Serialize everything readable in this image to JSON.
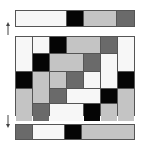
{
  "colors": {
    "white": "#f7f7f7",
    "black": "#050505",
    "lightgray": "#c4c4c4",
    "darkgray": "#6a6a6a",
    "border": "#555555"
  },
  "top_bar": {
    "segments": [
      {
        "color": "white",
        "width": 52
      },
      {
        "color": "black",
        "width": 17
      },
      {
        "color": "lightgray",
        "width": 34
      },
      {
        "color": "darkgray",
        "width": 17
      }
    ]
  },
  "grid": {
    "columns": 7,
    "rows": 5,
    "cells": [
      {
        "col": 1,
        "row": 1,
        "colspan": 1,
        "rowspan": 2,
        "color": "white"
      },
      {
        "col": 2,
        "row": 1,
        "colspan": 1,
        "rowspan": 1,
        "color": "white"
      },
      {
        "col": 3,
        "row": 1,
        "colspan": 1,
        "rowspan": 1,
        "color": "black"
      },
      {
        "col": 4,
        "row": 1,
        "colspan": 2,
        "rowspan": 1,
        "color": "lightgray"
      },
      {
        "col": 6,
        "row": 1,
        "colspan": 1,
        "rowspan": 1,
        "color": "darkgray"
      },
      {
        "col": 7,
        "row": 1,
        "colspan": 1,
        "rowspan": 2,
        "color": "white"
      },
      {
        "col": 2,
        "row": 2,
        "colspan": 1,
        "rowspan": 1,
        "color": "black"
      },
      {
        "col": 3,
        "row": 2,
        "colspan": 2,
        "rowspan": 1,
        "color": "lightgray"
      },
      {
        "col": 5,
        "row": 2,
        "colspan": 1,
        "rowspan": 1,
        "color": "darkgray"
      },
      {
        "col": 6,
        "row": 2,
        "colspan": 1,
        "rowspan": 2,
        "color": "white"
      },
      {
        "col": 1,
        "row": 3,
        "colspan": 1,
        "rowspan": 1,
        "color": "black"
      },
      {
        "col": 2,
        "row": 3,
        "colspan": 1,
        "rowspan": 2,
        "color": "lightgray"
      },
      {
        "col": 3,
        "row": 3,
        "colspan": 1,
        "rowspan": 1,
        "color": "lightgray"
      },
      {
        "col": 4,
        "row": 3,
        "colspan": 1,
        "rowspan": 1,
        "color": "darkgray"
      },
      {
        "col": 5,
        "row": 3,
        "colspan": 1,
        "rowspan": 1,
        "color": "white"
      },
      {
        "col": 7,
        "row": 3,
        "colspan": 1,
        "rowspan": 1,
        "color": "black"
      },
      {
        "col": 1,
        "row": 4,
        "colspan": 1,
        "rowspan": 2,
        "color": "lightgray"
      },
      {
        "col": 3,
        "row": 4,
        "colspan": 1,
        "rowspan": 1,
        "color": "darkgray"
      },
      {
        "col": 4,
        "row": 4,
        "colspan": 2,
        "rowspan": 1,
        "color": "white"
      },
      {
        "col": 6,
        "row": 4,
        "colspan": 1,
        "rowspan": 1,
        "color": "black"
      },
      {
        "col": 7,
        "row": 4,
        "colspan": 1,
        "rowspan": 2,
        "color": "lightgray"
      },
      {
        "col": 2,
        "row": 5,
        "colspan": 1,
        "rowspan": 1,
        "color": "darkgray"
      },
      {
        "col": 3,
        "row": 5,
        "colspan": 2,
        "rowspan": 1,
        "color": "white"
      },
      {
        "col": 5,
        "row": 5,
        "colspan": 1,
        "rowspan": 1,
        "color": "black"
      },
      {
        "col": 6,
        "row": 5,
        "colspan": 1,
        "rowspan": 1,
        "color": "lightgray"
      }
    ]
  },
  "bottom_bar": {
    "segments": [
      {
        "color": "darkgray",
        "width": 17
      },
      {
        "color": "white",
        "width": 33
      },
      {
        "color": "black",
        "width": 17
      },
      {
        "color": "lightgray",
        "width": 53
      }
    ]
  },
  "arrows": {
    "top": {
      "direction": "up",
      "icon": "arrow-up-icon"
    },
    "bottom": {
      "direction": "down",
      "icon": "arrow-down-icon"
    }
  }
}
